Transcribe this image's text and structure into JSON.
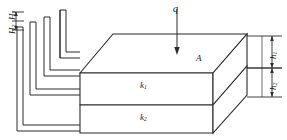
{
  "figure": {
    "type": "engineering-diagram",
    "background_color": "#ffffff",
    "line_color": "#2b2b2b"
  },
  "labels": {
    "flow": "q",
    "area": "A",
    "layer1_permeability": "k",
    "layer1_permeability_sub": "1",
    "layer2_permeability": "k",
    "layer2_permeability_sub": "2",
    "head2": "H",
    "head2_sub": "2",
    "head1": "H",
    "head1_sub": "1",
    "thickness1": "h",
    "thickness1_sub": "1",
    "thickness2": "h",
    "thickness2_sub": "2"
  },
  "piezometers": {
    "count": 4,
    "note": "Four L-shaped standpipes tapping the left face of the block at successive depths"
  },
  "dimensions": {
    "width": 287,
    "height": 140
  }
}
